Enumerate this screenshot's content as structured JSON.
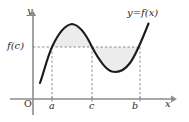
{
  "figure": {
    "kind": "calculus-graph",
    "background_color": "#ffffff"
  },
  "axes": {
    "x_axis": {
      "label": "x",
      "color": "#8d8d8d",
      "y_pixel": 99,
      "from_x": 10,
      "to_x": 174,
      "arrow": "right"
    },
    "y_axis": {
      "label": "y",
      "color": "#8d8d8d",
      "x_pixel": 33,
      "from_y": 114,
      "to_y": 13,
      "arrow": "up"
    },
    "origin_label": "O"
  },
  "ticks": {
    "x_ticks": [
      {
        "label": "a",
        "x_pixel": 52
      },
      {
        "label": "c",
        "x_pixel": 92
      },
      {
        "label": "b",
        "x_pixel": 140
      }
    ],
    "y_ticks": [
      {
        "label": "f(c)",
        "y_pixel": 47
      }
    ]
  },
  "curve": {
    "label": "y=f(x)",
    "color": "#1b1b1b",
    "stroke_width": 2.1,
    "points": [
      {
        "x": 40,
        "y": 82
      },
      {
        "x": 52,
        "y": 47
      },
      {
        "x": 72,
        "y": 24
      },
      {
        "x": 92,
        "y": 47
      },
      {
        "x": 110,
        "y": 70
      },
      {
        "x": 122,
        "y": 72
      },
      {
        "x": 140,
        "y": 47
      },
      {
        "x": 149,
        "y": 24
      }
    ],
    "local_maximum": {
      "x": 72,
      "y": 24
    },
    "local_minimum": {
      "x": 118,
      "y": 72
    }
  },
  "level_line": {
    "value_label": "f(c)",
    "y_pixel": 47,
    "from_x": 33,
    "to_x": 140,
    "style": "dashed",
    "color": "#808080"
  },
  "dashed_verticals": [
    {
      "label": "a",
      "x_pixel": 52,
      "from_y": 47,
      "to_y": 99
    },
    {
      "label": "c",
      "x_pixel": 92,
      "from_y": 47,
      "to_y": 99
    },
    {
      "label": "b",
      "x_pixel": 140,
      "from_y": 47,
      "to_y": 99
    }
  ],
  "shaded_regions": [
    {
      "name": "upper-region",
      "between": "a-to-c",
      "position": "above-level-line",
      "fill_color": "#ececec"
    },
    {
      "name": "lower-region",
      "between": "c-to-b",
      "position": "below-level-line",
      "fill_color": "#ececec"
    }
  ],
  "colors": {
    "curve": "#1b1b1b",
    "axis": "#8d8d8d",
    "dash": "#808080",
    "shade": "#ececec",
    "text": "#2b2b2b",
    "background": "#ffffff"
  }
}
